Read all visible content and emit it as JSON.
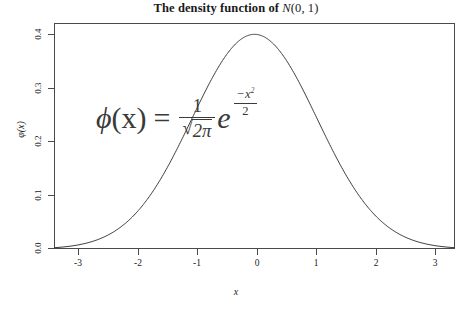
{
  "chart_data": {
    "type": "line",
    "title_plain": "The density function of ",
    "title_math": "N",
    "title_math_args": "(0, 1)",
    "xlabel": "x",
    "ylabel": "φ(x)",
    "xlim": [
      -3.2,
      3.2
    ],
    "ylim": [
      0.0,
      0.42
    ],
    "xticks": [
      "-3",
      "-2",
      "-1",
      "0",
      "1",
      "2",
      "3"
    ],
    "xtick_values": [
      -3,
      -2,
      -1,
      0,
      1,
      2,
      3
    ],
    "yticks": [
      "0.0",
      "0.1",
      "0.2",
      "0.3",
      "0.4"
    ],
    "ytick_values": [
      0.0,
      0.1,
      0.2,
      0.3,
      0.4
    ],
    "grid": false,
    "legend": null,
    "line_color": "#3a3a3a",
    "frame_color": "#4a4a4a",
    "background": "#ffffff",
    "series": [
      {
        "name": "phi(x)",
        "x": [
          -3.2,
          -3.0,
          -2.8,
          -2.6,
          -2.4,
          -2.2,
          -2.0,
          -1.8,
          -1.6,
          -1.4,
          -1.2,
          -1.0,
          -0.8,
          -0.6,
          -0.4,
          -0.2,
          0.0,
          0.2,
          0.4,
          0.6,
          0.8,
          1.0,
          1.2,
          1.4,
          1.6,
          1.8,
          2.0,
          2.2,
          2.4,
          2.6,
          2.8,
          3.0,
          3.2
        ],
        "y": [
          0.0024,
          0.0044,
          0.0079,
          0.0136,
          0.0224,
          0.0355,
          0.054,
          0.079,
          0.1109,
          0.1497,
          0.1942,
          0.242,
          0.2897,
          0.3332,
          0.3683,
          0.391,
          0.3989,
          0.391,
          0.3683,
          0.3332,
          0.2897,
          0.242,
          0.1942,
          0.1497,
          0.1109,
          0.079,
          0.054,
          0.0355,
          0.0224,
          0.0136,
          0.0079,
          0.0044,
          0.0024
        ]
      }
    ],
    "annotation": {
      "text": "φ(x) = 1/√(2π) e^(-x²/2)",
      "lhs_phi": "ϕ",
      "lhs_arg": "(x)",
      "equals": "=",
      "numerator": "1",
      "radical": "√",
      "radicand": "2π",
      "base": "e",
      "exp_numerator": "−x",
      "exp_superscript": "2",
      "exp_denominator": "2",
      "color": "#3a3a3a"
    }
  }
}
